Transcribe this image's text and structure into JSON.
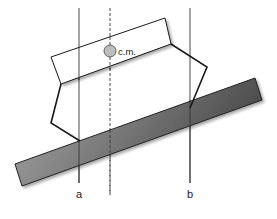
{
  "diagram": {
    "labels": {
      "center_of_mass": "c.m.",
      "line_a": "a",
      "line_b": "b"
    },
    "colors": {
      "background": "#ffffff",
      "outline": "#1a1a1a",
      "ramp_light": "#9a9a9a",
      "ramp_dark": "#4a4a4a",
      "cm_fill": "#bdbdbd",
      "cm_stroke": "#555555",
      "guide_line": "#333333"
    },
    "elements": [
      "inclined-ramp",
      "tilted-box",
      "left-leg",
      "right-leg",
      "vertical-line-a",
      "vertical-line-b",
      "dashed-cm-line",
      "center-of-mass-marker"
    ]
  }
}
